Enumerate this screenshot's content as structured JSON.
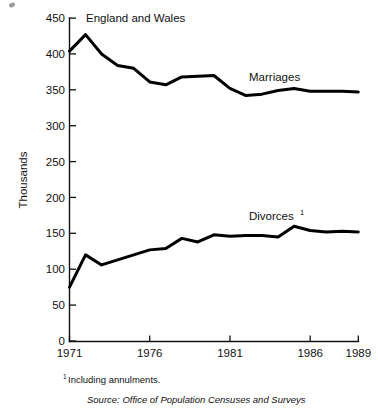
{
  "chart_data": {
    "type": "line",
    "title": "England and Wales",
    "xlabel": "",
    "ylabel": "Thousands",
    "xlim": [
      1971,
      1989
    ],
    "ylim": [
      0,
      450
    ],
    "grid": false,
    "legend_position": "inline-labels",
    "x": [
      1971,
      1972,
      1973,
      1974,
      1975,
      1976,
      1977,
      1978,
      1979,
      1980,
      1981,
      1982,
      1983,
      1984,
      1985,
      1986,
      1987,
      1988,
      1989
    ],
    "xticks": [
      1971,
      1976,
      1981,
      1986,
      1989
    ],
    "xticklabels": [
      "1971",
      "1976",
      "1981",
      "1986",
      "1989"
    ],
    "yticks": [
      0,
      50,
      100,
      150,
      200,
      250,
      300,
      350,
      400,
      450
    ],
    "yticklabels": [
      "0",
      "50",
      "100",
      "150",
      "200",
      "250",
      "300",
      "350",
      "400",
      "450"
    ],
    "series": [
      {
        "name": "Marriages",
        "label": "Marriages",
        "label_sup": "",
        "values": [
          404,
          427,
          400,
          384,
          380,
          361,
          357,
          368,
          369,
          370,
          352,
          342,
          344,
          349,
          352,
          348,
          348,
          348,
          347
        ]
      },
      {
        "name": "Divorces",
        "label": "Divorces",
        "label_sup": "1",
        "values": [
          75,
          120,
          106,
          113,
          120,
          127,
          129,
          143,
          138,
          148,
          146,
          147,
          147,
          145,
          160,
          154,
          152,
          153,
          152
        ]
      }
    ],
    "annotations": [
      {
        "name": "footnote",
        "text": "Including annulments.",
        "marker": "1"
      },
      {
        "name": "source",
        "text": "Source:  Office of Population Censuses and Surveys"
      }
    ],
    "colors": {
      "line": "#000000",
      "text": "#111111",
      "background": "#ffffff"
    }
  }
}
